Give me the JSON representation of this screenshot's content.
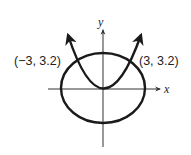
{
  "figure": {
    "axes": {
      "x_label": "x",
      "y_label": "y"
    },
    "curves": [
      {
        "type": "ellipse",
        "name": "ellipse"
      },
      {
        "type": "parabola",
        "name": "parabola",
        "vertex": [
          0,
          0
        ],
        "opens": "up"
      }
    ],
    "intersections": [
      {
        "label": "(−3, 3.2)",
        "x": -3,
        "y": 3.2
      },
      {
        "label": "(3, 3.2)",
        "x": 3,
        "y": 3.2
      }
    ],
    "colors": {
      "stroke": "#1a1a1a",
      "axis": "#333333",
      "background": "#ffffff"
    }
  }
}
